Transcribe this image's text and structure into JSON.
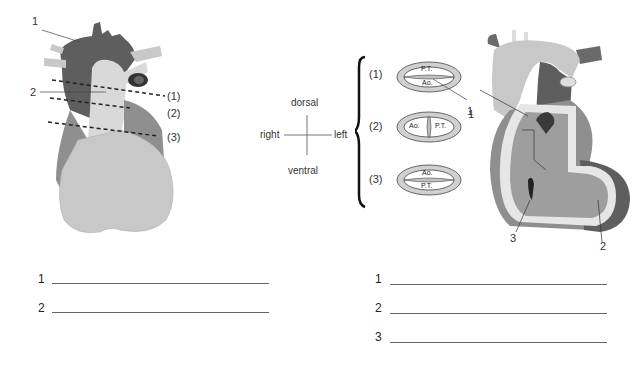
{
  "left_figure": {
    "labels": [
      "1",
      "2"
    ],
    "section_labels": [
      "(1)",
      "(2)",
      "(3)"
    ]
  },
  "orientation": {
    "top": "dorsal",
    "bottom": "ventral",
    "left": "right",
    "right": "left"
  },
  "sections": [
    {
      "label": "(1)",
      "top_text": "P.T.",
      "bottom_text": "Ao."
    },
    {
      "label": "(2)",
      "left_text": "Ao.",
      "right_text": "P.T."
    },
    {
      "label": "(3)",
      "top_text": "Ao.",
      "bottom_text": "P.T."
    }
  ],
  "section_pointer_label": "1",
  "right_figure": {
    "labels": [
      "1",
      "2",
      "3"
    ]
  },
  "answer_blanks_left": [
    "1",
    "2"
  ],
  "answer_blanks_right": [
    "1",
    "2",
    "3"
  ],
  "colors": {
    "dark": "#5e5e5e",
    "mid": "#8f8f8f",
    "light": "#c8c8c8",
    "pale": "#e2e2e2"
  }
}
